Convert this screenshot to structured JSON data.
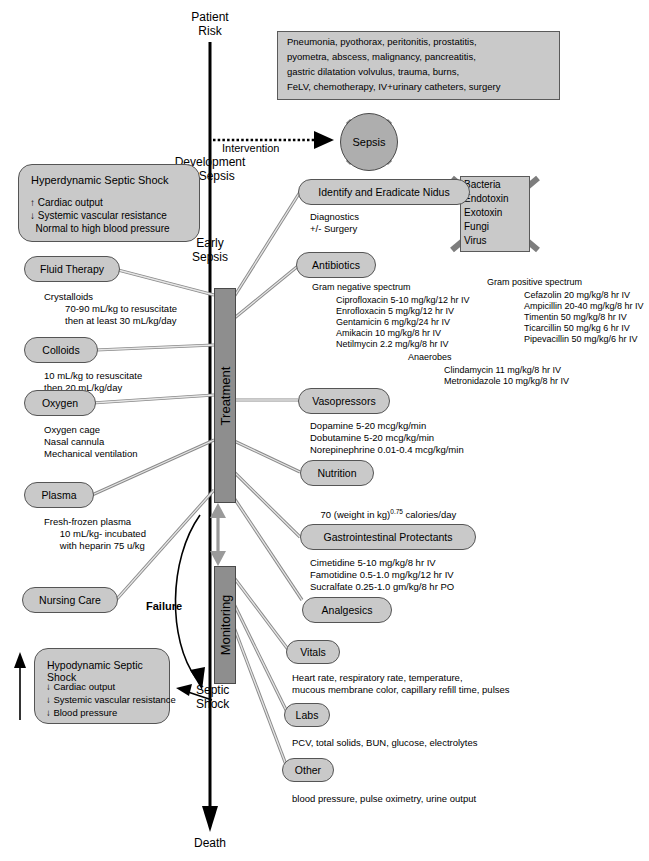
{
  "timeline": {
    "stages": [
      {
        "id": "patient-risk",
        "label": "Patient\nRisk"
      },
      {
        "id": "development-of-sepsis",
        "label": "Development\nof Sepsis"
      },
      {
        "id": "early-sepsis",
        "label": "Early\nSepsis"
      },
      {
        "id": "septic-shock",
        "label": "Septic\nShock"
      },
      {
        "id": "death",
        "label": "Death"
      }
    ],
    "intervention_label": "Intervention",
    "failure_label": "Failure"
  },
  "risk_factors": {
    "lines": [
      "Pneumonia, pyothorax, peritonitis, prostatitis,",
      "pyometra, abscess, malignancy, pancreatitis,",
      "gastric dilatation volvulus, trauma, burns,",
      "FeLV, chemotherapy, IV+urinary catheters, surgery"
    ]
  },
  "sepsis_node": {
    "label": "Sepsis",
    "crossed_out": true
  },
  "pathogens_box": {
    "items": [
      "Bacteria",
      "Endotoxin",
      "Exotoxin",
      "Fungi",
      "Virus"
    ],
    "crossed_out": true
  },
  "shock_panels": [
    {
      "id": "hyperdynamic",
      "title": "Hyperdynamic Septic Shock",
      "rows": [
        "↑ Cardiac output",
        "↓ Systemic vascular resistance",
        "  Normal to high blood pressure"
      ]
    },
    {
      "id": "hypodynamic",
      "title": "Hypodynamic Septic Shock",
      "rows": [
        "↓ Cardiac output",
        "↓ Systemic vascular resistance",
        "↓ Blood pressure"
      ]
    }
  ],
  "bars": [
    {
      "id": "treatment",
      "label": "Treatment"
    },
    {
      "id": "monitoring",
      "label": "Monitoring"
    }
  ],
  "left_nodes": [
    {
      "id": "fluid-therapy",
      "label": "Fluid Therapy",
      "details": [
        "Crystalloids",
        "        70-90 mL/kg to resuscitate",
        "        then at least 30 mL/kg/day"
      ]
    },
    {
      "id": "colloids",
      "label": "Colloids",
      "details": [
        "10 mL/kg to resuscitate",
        "then 20 mL/kg/day"
      ]
    },
    {
      "id": "oxygen",
      "label": "Oxygen",
      "details": [
        "Oxygen cage",
        "Nasal cannula",
        "Mechanical ventilation"
      ]
    },
    {
      "id": "plasma",
      "label": "Plasma",
      "details": [
        "Fresh-frozen plasma",
        "      10 mL/kg- incubated",
        "      with heparin 75 u/kg"
      ]
    },
    {
      "id": "nursing-care",
      "label": "Nursing Care",
      "details": []
    }
  ],
  "right_nodes": [
    {
      "id": "identify-eradicate-nidus",
      "label": "Identify and Eradicate Nidus",
      "details": [
        "Diagnostics",
        "+/- Surgery"
      ]
    },
    {
      "id": "antibiotics",
      "label": "Antibiotics",
      "details": []
    },
    {
      "id": "vasopressors",
      "label": "Vasopressors",
      "details": [
        "Dopamine 5-20 mcg/kg/min",
        "Dobutamine 5-20 mcg/kg/min",
        "Norepinephrine 0.01-0.4 mcg/kg/min"
      ]
    },
    {
      "id": "nutrition",
      "label": "Nutrition",
      "details": []
    },
    {
      "id": "gastrointestinal-protectants",
      "label": "Gastrointestinal Protectants",
      "details": [
        "Cimetidine 5-10 mg/kg/8 hr IV",
        "Famotidine 0.5-1.0 mg/kg/12 hr IV",
        "Sucralfate 0.25-1.0 gm/kg/8 hr PO"
      ]
    },
    {
      "id": "analgesics",
      "label": "Analgesics",
      "details": []
    },
    {
      "id": "vitals",
      "label": "Vitals",
      "details": [
        "Heart rate, respiratory rate, temperature,",
        "mucous membrane color, capillary refill time, pulses"
      ]
    },
    {
      "id": "labs",
      "label": "Labs",
      "details": [
        "PCV, total solids, BUN, glucose, electrolytes"
      ]
    },
    {
      "id": "other",
      "label": "Other",
      "details": [
        "blood pressure, pulse oximetry, urine output"
      ]
    }
  ],
  "antibiotics": {
    "gram_negative": {
      "heading": "Gram negative spectrum",
      "drugs": [
        "Ciprofloxacin 5-10 mg/kg/12 hr IV",
        "Enrofloxacin 5 mg/kg/12 hr IV",
        "Gentamicin 6 mg/kg/24 hr IV",
        "Amikacin 10 mg/kg/8 hr IV",
        "Netilmycin 2.2 mg/kg/8 hr IV"
      ]
    },
    "gram_positive": {
      "heading": "Gram positive spectrum",
      "drugs": [
        "Cefazolin 20 mg/kg/8 hr IV",
        "Ampicillin 20-40 mg/kg/8 hr IV",
        "Timentin 50 mg/kg/8 hr IV",
        "Ticarcillin 50 mg/kg 6 hr IV",
        "Pipevacillin 50 mg/kg/6 hr IV"
      ]
    },
    "anaerobes": {
      "heading": "Anaerobes",
      "drugs": [
        "Clindamycin 11 mg/kg/8 hr IV",
        "Metronidazole 10 mg/kg/8 hr IV"
      ]
    }
  },
  "nutrition_formula": {
    "prefix": "70 (weight in kg)",
    "exponent": "0.75",
    "suffix": " calories/day"
  },
  "colors": {
    "node_fill": "#c9c9c9",
    "bar_fill": "#8e8e8e",
    "circle_fill": "#aeaeae",
    "connector": "#8a8a8a",
    "outline": "#555555"
  }
}
